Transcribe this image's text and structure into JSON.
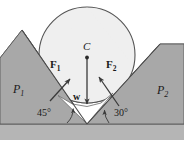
{
  "figure": {
    "type": "physics-free-body-diagram",
    "width": 184,
    "height": 145,
    "colors": {
      "background": "#ffffff",
      "wedge_fill": "#a8a8a8",
      "ground_fill": "#b5b5b5",
      "ball_fill": "#efefef",
      "outline": "#4a4a4a",
      "arrow": "#3a3a3a",
      "text": "#1a1a1a"
    },
    "ball": {
      "center_label": "C",
      "center_x": 87,
      "center_y": 55,
      "radius": 48,
      "contact_point_left": {
        "x": 52,
        "y": 89
      },
      "contact_point_right": {
        "x": 120,
        "y": 79
      }
    },
    "forces": [
      {
        "name": "normal-force-left",
        "label": "F",
        "subscript": "1",
        "direction_deg": 45,
        "tail": {
          "x": 50,
          "y": 101
        },
        "head": {
          "x": 71,
          "y": 78
        }
      },
      {
        "name": "normal-force-right",
        "label": "F",
        "subscript": "2",
        "direction_deg": 120,
        "tail": {
          "x": 119,
          "y": 106
        },
        "head": {
          "x": 98,
          "y": 75
        }
      },
      {
        "name": "weight",
        "label": "w",
        "subscript": "",
        "direction_deg": 270,
        "tail": {
          "x": 87,
          "y": 58
        },
        "head": {
          "x": 87,
          "y": 105
        }
      }
    ],
    "angles": [
      {
        "name": "left-incline-angle",
        "value": "45",
        "unit": "°",
        "text": "45°"
      },
      {
        "name": "right-incline-angle",
        "value": "30",
        "unit": "°",
        "text": "30°"
      }
    ],
    "planes": [
      {
        "name": "plane-left",
        "label": "P",
        "subscript": "1",
        "inclination_deg": 45
      },
      {
        "name": "plane-right",
        "label": "P",
        "subscript": "2",
        "inclination_deg": 30
      }
    ],
    "ground": {
      "name": "ground-line",
      "y": 123
    }
  }
}
